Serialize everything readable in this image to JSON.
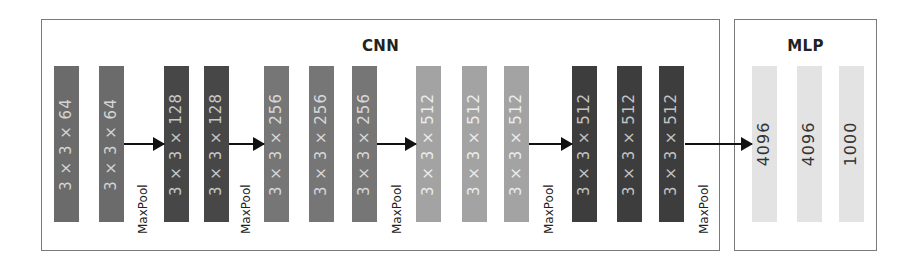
{
  "cnn": {
    "title": "CNN",
    "box": {
      "x": 41,
      "y": 19,
      "w": 679,
      "h": 232
    },
    "blocks": [
      {
        "label": "3 × 3 × 64",
        "x": 54,
        "color": "#6b6b6b",
        "text_color": "#d4d4d4"
      },
      {
        "label": "3 × 3 × 64",
        "x": 99,
        "color": "#6b6b6b",
        "text_color": "#d4d4d4"
      },
      {
        "label": "3 × 3 × 128",
        "x": 164,
        "color": "#474747",
        "text_color": "#c8c8c8"
      },
      {
        "label": "3 × 3 × 128",
        "x": 204,
        "color": "#474747",
        "text_color": "#c8c8c8"
      },
      {
        "label": "3 × 3 × 256",
        "x": 264,
        "color": "#767676",
        "text_color": "#d8d8d8"
      },
      {
        "label": "3 × 3 × 256",
        "x": 309,
        "color": "#767676",
        "text_color": "#d8d8d8"
      },
      {
        "label": "3 × 3 × 256",
        "x": 352,
        "color": "#767676",
        "text_color": "#d8d8d8"
      },
      {
        "label": "3 × 3 × 512",
        "x": 416,
        "color": "#a3a3a3",
        "text_color": "#ececec"
      },
      {
        "label": "3 × 3 × 512",
        "x": 462,
        "color": "#a3a3a3",
        "text_color": "#ececec"
      },
      {
        "label": "3 × 3 × 512",
        "x": 504,
        "color": "#a3a3a3",
        "text_color": "#ececec"
      },
      {
        "label": "3 × 3 × 512",
        "x": 572,
        "color": "#3d3d3d",
        "text_color": "#c4c4c4"
      },
      {
        "label": "3 × 3 × 512",
        "x": 617,
        "color": "#3d3d3d",
        "text_color": "#c4c4c4"
      },
      {
        "label": "3 × 3 × 512",
        "x": 659,
        "color": "#3d3d3d",
        "text_color": "#c4c4c4"
      }
    ],
    "pool_label": "MaxPool",
    "pools": [
      {
        "label": "MaxPool",
        "arrow_x1": 124,
        "arrow_x2": 164,
        "label_x": 136
      },
      {
        "label": "MaxPool",
        "arrow_x1": 229,
        "arrow_x2": 264,
        "label_x": 240
      },
      {
        "label": "MaxPool",
        "arrow_x1": 377,
        "arrow_x2": 416,
        "label_x": 390
      },
      {
        "label": "MaxPool",
        "arrow_x1": 529,
        "arrow_x2": 572,
        "label_x": 543
      },
      {
        "label": "MaxPool",
        "arrow_x1": 685,
        "arrow_x2": 752,
        "label_x": 698
      }
    ]
  },
  "mlp": {
    "title": "MLP",
    "box": {
      "x": 734,
      "y": 19,
      "w": 143,
      "h": 232
    },
    "blocks": [
      {
        "label": "4096",
        "x": 752,
        "color": "#e3e3e3",
        "text_color": "#333333"
      },
      {
        "label": "4096",
        "x": 797,
        "color": "#e3e3e3",
        "text_color": "#333333"
      },
      {
        "label": "1000",
        "x": 839,
        "color": "#e3e3e3",
        "text_color": "#333333"
      }
    ]
  }
}
